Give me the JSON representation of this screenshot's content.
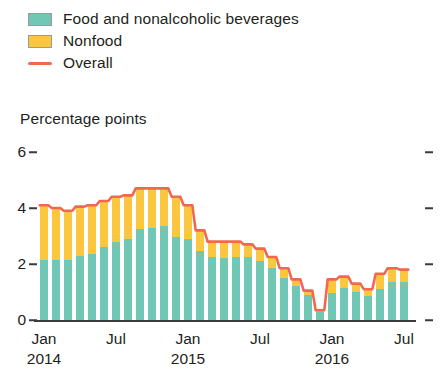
{
  "legend": {
    "items": [
      {
        "label": "Food and nonalcoholic beverages",
        "marker": "swatch",
        "color": "#6FC7B4",
        "name": "legend-item-food"
      },
      {
        "label": "Nonfood",
        "marker": "swatch",
        "color": "#FBC73F",
        "name": "legend-item-nonfood"
      },
      {
        "label": "Overall",
        "marker": "line",
        "color": "#F4674F",
        "name": "legend-item-overall"
      }
    ]
  },
  "axis_title": "Percentage points",
  "colors": {
    "food": "#6FC7B4",
    "nonfood": "#FBC73F",
    "overall": "#F4674F",
    "axis": "#3b3b3b",
    "text": "#231f20",
    "swatch_border": "#9a9a9a",
    "background": "#ffffff"
  },
  "chart_data": {
    "type": "bar",
    "title": "",
    "subtitle": "",
    "xlabel": "",
    "ylabel": "Percentage points",
    "ylim": [
      0,
      6
    ],
    "yticks": [
      0,
      2,
      4,
      6
    ],
    "ytick_labels": [
      "0",
      "2",
      "4",
      "6"
    ],
    "grid": false,
    "stacked": true,
    "legend_position": "top-left",
    "x_tick_positions": [
      0,
      6,
      12,
      18,
      24,
      30
    ],
    "x_tick_months": [
      "Jan",
      "Jul",
      "Jan",
      "Jul",
      "Jan",
      "Jul"
    ],
    "x_tick_years": [
      "2014",
      "",
      "2015",
      "",
      "2016",
      ""
    ],
    "categories": [
      "Jan 2014",
      "Feb 2014",
      "Mar 2014",
      "Apr 2014",
      "May 2014",
      "Jun 2014",
      "Jul 2014",
      "Aug 2014",
      "Sep 2014",
      "Oct 2014",
      "Nov 2014",
      "Dec 2014",
      "Jan 2015",
      "Feb 2015",
      "Mar 2015",
      "Apr 2015",
      "May 2015",
      "Jun 2015",
      "Jul 2015",
      "Aug 2015",
      "Sep 2015",
      "Oct 2015",
      "Nov 2015",
      "Dec 2015",
      "Jan 2016",
      "Feb 2016",
      "Mar 2016",
      "Apr 2016",
      "May 2016",
      "Jun 2016",
      "Jul 2016"
    ],
    "series": [
      {
        "name": "Food and nonalcoholic beverages",
        "color": "#6FC7B4",
        "values": [
          2.15,
          2.15,
          2.15,
          2.3,
          2.35,
          2.6,
          2.8,
          2.9,
          3.25,
          3.3,
          3.35,
          2.95,
          2.9,
          2.45,
          2.25,
          2.2,
          2.25,
          2.25,
          2.1,
          1.85,
          1.5,
          1.2,
          0.9,
          0.3,
          0.95,
          1.15,
          1.0,
          0.85,
          1.1,
          1.35,
          1.35
        ]
      },
      {
        "name": "Nonfood",
        "color": "#FBC73F",
        "values": [
          1.95,
          1.85,
          1.75,
          1.75,
          1.75,
          1.65,
          1.6,
          1.55,
          1.45,
          1.4,
          1.35,
          1.45,
          1.2,
          0.75,
          0.55,
          0.6,
          0.55,
          0.45,
          0.45,
          0.4,
          0.35,
          0.25,
          0.15,
          0.05,
          0.5,
          0.4,
          0.3,
          0.25,
          0.55,
          0.5,
          0.45
        ]
      }
    ],
    "overall": {
      "name": "Overall",
      "color": "#F4674F",
      "values": [
        4.1,
        4.0,
        3.9,
        4.05,
        4.1,
        4.25,
        4.4,
        4.45,
        4.7,
        4.7,
        4.7,
        4.4,
        4.1,
        3.2,
        2.8,
        2.8,
        2.8,
        2.7,
        2.55,
        2.25,
        1.85,
        1.45,
        1.05,
        0.35,
        1.45,
        1.55,
        1.3,
        1.1,
        1.65,
        1.85,
        1.8
      ]
    }
  }
}
